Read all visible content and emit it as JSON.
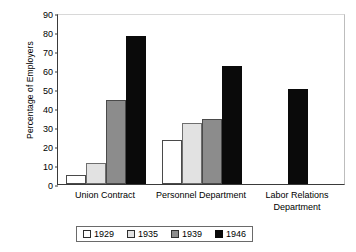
{
  "chart_data": {
    "type": "bar",
    "title": "",
    "subtitle": "",
    "xlabel": "",
    "ylabel": "Percentage of Employers",
    "ylim": [
      0,
      90
    ],
    "ytick_step": 10,
    "yticks": [
      "90",
      "80",
      "70",
      "60",
      "50",
      "40",
      "30",
      "20",
      "10",
      "0"
    ],
    "grid": false,
    "legend_position": "bottom-center",
    "categories": [
      "Union Contract",
      "Personnel Department",
      "Labor Relations Department"
    ],
    "category_lines": [
      [
        "Union Contract"
      ],
      [
        "Personnel Department"
      ],
      [
        "Labor Relations",
        "Department"
      ]
    ],
    "series": [
      {
        "name": "1929",
        "color": "#ffffff",
        "values": [
          5,
          23,
          null
        ]
      },
      {
        "name": "1935",
        "color": "#e2e2e2",
        "values": [
          11,
          32,
          null
        ]
      },
      {
        "name": "1939",
        "color": "#8c8c8c",
        "values": [
          44,
          34,
          null
        ]
      },
      {
        "name": "1946",
        "color": "#0a0a0a",
        "values": [
          78,
          62,
          50
        ]
      }
    ]
  },
  "legend": {
    "entries": [
      {
        "label": "1929"
      },
      {
        "label": "1935"
      },
      {
        "label": "1939"
      },
      {
        "label": "1946"
      }
    ]
  }
}
